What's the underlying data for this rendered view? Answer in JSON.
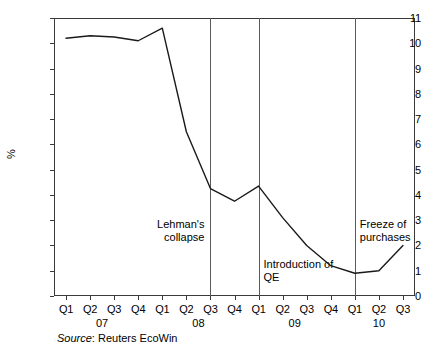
{
  "chart_data": {
    "type": "line",
    "title": "",
    "xlabel": "",
    "ylabel": "%",
    "ylim": [
      0,
      11
    ],
    "ytick_step": 1,
    "grid": false,
    "legend": "none",
    "categories": [
      "Q1",
      "Q2",
      "Q3",
      "Q4",
      "Q1",
      "Q2",
      "Q3",
      "Q4",
      "Q1",
      "Q2",
      "Q3",
      "Q4",
      "Q1",
      "Q2",
      "Q3"
    ],
    "period_labels": [
      "Q1 07",
      "Q2 07",
      "Q3 07",
      "Q4 07",
      "Q1 08",
      "Q2 08",
      "Q3 08",
      "Q4 08",
      "Q1 09",
      "Q2 09",
      "Q3 09",
      "Q4 09",
      "Q1 10",
      "Q2 10",
      "Q3 10"
    ],
    "values": [
      10.2,
      10.3,
      10.25,
      10.1,
      10.6,
      6.5,
      4.25,
      3.75,
      4.35,
      3.1,
      2.0,
      1.2,
      0.9,
      1.0,
      2.0
    ],
    "years": [
      "07",
      "08",
      "09",
      "10"
    ],
    "ytick_labels": [
      "0",
      "1",
      "2",
      "3",
      "4",
      "5",
      "6",
      "7",
      "8",
      "9",
      "10",
      "11"
    ],
    "annotations": [
      {
        "label": "Lehman's\ncollapse",
        "at_period": "Q3 08"
      },
      {
        "label": "Introduction of\nQE",
        "at_period": "Q1 09"
      },
      {
        "label": "Freeze of\npurchases",
        "at_period": "Q1 10"
      }
    ],
    "series_color": "#1a1a1a",
    "axis_color": "#3a3a3a",
    "event_line_color": "#5a5a5a"
  },
  "source": {
    "prefix": "Source",
    "text": ": Reuters EcoWin"
  }
}
